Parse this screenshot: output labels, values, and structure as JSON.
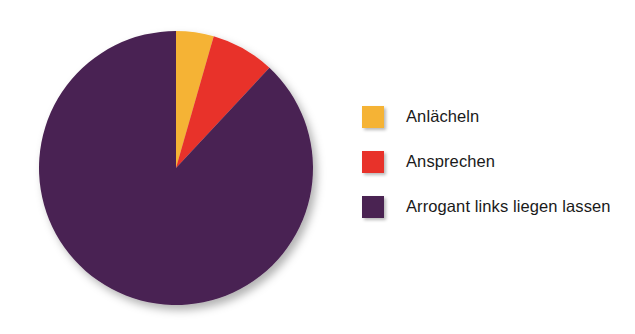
{
  "chart_data": {
    "type": "pie",
    "title": "",
    "subtitle": "",
    "xlabel": "",
    "ylabel": "",
    "grid": false,
    "legend_position": "right",
    "start_angle_deg": 0,
    "direction": "clockwise",
    "categories": [
      "Anlächeln",
      "Ansprechen",
      "Arrogant links liegen lassen"
    ],
    "values": [
      4.5,
      7.5,
      88.0
    ],
    "units": "percent",
    "slices": [
      {
        "label": "Anlächeln",
        "value": 4.5,
        "color": "#F5B335",
        "start_angle_deg": 0,
        "end_angle_deg": 16
      },
      {
        "label": "Ansprechen",
        "value": 7.5,
        "color": "#E8322A",
        "start_angle_deg": 16,
        "end_angle_deg": 43
      },
      {
        "label": "Arrogant links liegen lassen",
        "value": 88.0,
        "color": "#4A2352",
        "start_angle_deg": 43,
        "end_angle_deg": 360
      }
    ]
  },
  "legend": {
    "items": [
      {
        "label": "Anlächeln",
        "color": "#F5B335"
      },
      {
        "label": "Ansprechen",
        "color": "#E8322A"
      },
      {
        "label": "Arrogant links liegen lassen",
        "color": "#4A2352"
      }
    ]
  },
  "colors": {
    "slice_yellow": "#F5B335",
    "slice_red": "#E8322A",
    "slice_purple": "#4A2352",
    "background": "#FFFFFF",
    "legend_text": "#1A1A1A"
  },
  "geometry": {
    "center_x": 176,
    "center_y": 168,
    "radius": 137
  }
}
